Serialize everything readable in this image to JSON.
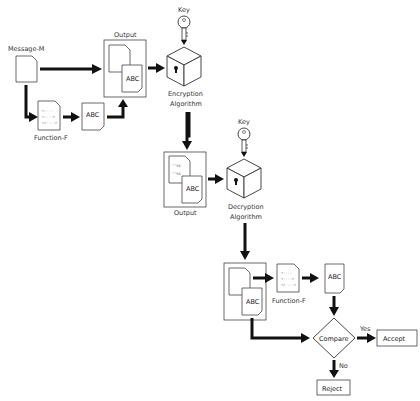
{
  "diagram": {
    "nodes": {
      "message": {
        "label": "Message-M"
      },
      "function_top": {
        "label": "Function-F",
        "code_lines": [
          "<----",
          "<---->",
          "</---->"
        ]
      },
      "abc_top": {
        "label": "ABC"
      },
      "output_top": {
        "label": "Output",
        "abc": "ABC"
      },
      "key_top": {
        "label": "Key"
      },
      "encryption": {
        "label_line1": "Encryption",
        "label_line2": "Algorithm"
      },
      "output_mid": {
        "label": "Output",
        "cipher_lines": [
          "^\"%$",
          "^\"%$"
        ],
        "abc": "ABC"
      },
      "key_mid": {
        "label": "Key"
      },
      "decryption": {
        "label_line1": "Decryption",
        "label_line2": "Algorithm"
      },
      "received_abc": {
        "abc": "ABC"
      },
      "function_bottom": {
        "label": "Function-F",
        "code_lines": [
          "<----",
          "<---->",
          "</---->"
        ]
      },
      "abc_bottom": {
        "label": "ABC"
      },
      "compare": {
        "label": "Compare"
      },
      "accept": {
        "label": "Accept"
      },
      "reject": {
        "label": "Reject"
      }
    },
    "edges": {
      "yes": "Yes",
      "no": "No"
    }
  }
}
